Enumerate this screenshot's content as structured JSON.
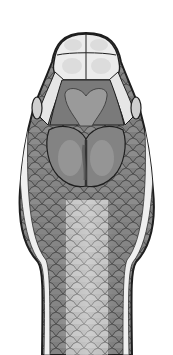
{
  "image": {
    "subject": "snake head, dorsal view illustration",
    "background": "#ffffff",
    "colors": {
      "outline": "#222222",
      "light_scale": "#e6e6e6",
      "mid_scale": "#8a8a8a",
      "dark_scale": "#6e6e6e",
      "shield": "#7a7a7a",
      "shield_highlight": "#b0b0b0",
      "belly_stripe": "#c8c8c8"
    }
  }
}
